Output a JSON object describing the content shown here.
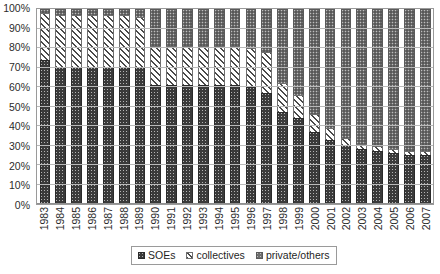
{
  "chart_data": {
    "type": "bar",
    "variant": "100%-stacked-column",
    "title": "",
    "subtitle": "",
    "xlabel": "",
    "ylabel": "",
    "ylim": [
      0,
      100
    ],
    "yticks": [
      "0%",
      "10%",
      "20%",
      "30%",
      "40%",
      "50%",
      "60%",
      "70%",
      "80%",
      "90%",
      "100%"
    ],
    "ytick_values": [
      0,
      10,
      20,
      30,
      40,
      50,
      60,
      70,
      80,
      90,
      100
    ],
    "grid": true,
    "grid_axis": "y",
    "legend_position": "bottom-center",
    "legend_border": true,
    "stack_order_bottom_to_top": [
      "SOEs",
      "collectives",
      "private/others"
    ],
    "categories": [
      "1983",
      "1984",
      "1985",
      "1986",
      "1987",
      "1988",
      "1989",
      "1990",
      "1991",
      "1992",
      "1993",
      "1994",
      "1995",
      "1996",
      "1997",
      "1998",
      "1999",
      "2000",
      "2001",
      "2002",
      "2003",
      "2004",
      "2005",
      "2006",
      "2007"
    ],
    "series": [
      {
        "name": "SOEs",
        "fill": "dark-checkered",
        "color": "#3a3a3a",
        "values": [
          74,
          70,
          70,
          70,
          70,
          70,
          70,
          61,
          61,
          61,
          61,
          61,
          61,
          60,
          57,
          47,
          44,
          37,
          33,
          30,
          28,
          27,
          26,
          25,
          25
        ]
      },
      {
        "name": "collectives",
        "fill": "white-diagonal-hatch",
        "color": "#ffffff",
        "values": [
          24,
          27,
          27,
          27,
          27,
          27,
          26,
          20,
          20,
          20,
          20,
          20,
          20,
          20,
          21,
          15,
          12,
          9,
          6,
          4,
          3,
          3,
          2,
          2,
          2
        ]
      },
      {
        "name": "private/others",
        "fill": "gray-dotted",
        "color": "#6f6f6f",
        "values": [
          2,
          3,
          3,
          3,
          3,
          3,
          4,
          19,
          19,
          19,
          19,
          19,
          19,
          20,
          22,
          38,
          44,
          54,
          61,
          66,
          69,
          70,
          72,
          73,
          73
        ]
      }
    ]
  },
  "legend": {
    "items": [
      {
        "label": "SOEs",
        "key": "s-soe"
      },
      {
        "label": "collectives",
        "key": "s-collective"
      },
      {
        "label": "private/others",
        "key": "s-private"
      }
    ]
  }
}
